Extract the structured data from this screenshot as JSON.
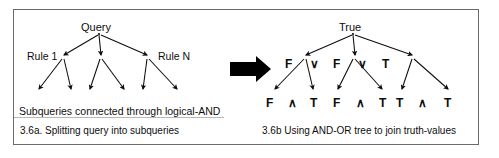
{
  "figure": {
    "ink_color": "#0d0d0d",
    "frame_color": "#6a6a6a",
    "background": "#ffffff"
  },
  "left_panel": {
    "root_label": "Query",
    "rule_left_label": "Rule 1",
    "rule_right_label": "Rule N",
    "summary_text": "Subqueries connected through logical-AND",
    "caption": "3.6a.  Splitting query into subqueries",
    "tree": {
      "root": {
        "x": 97,
        "y": 30,
        "label": "Query"
      },
      "level1": [
        {
          "x": 63,
          "y": 57
        },
        {
          "x": 100,
          "y": 57
        },
        {
          "x": 148,
          "y": 57
        }
      ],
      "leaves": [
        {
          "x": 38,
          "y": 92
        },
        {
          "x": 71,
          "y": 92
        },
        {
          "x": 101,
          "y": 92
        },
        {
          "x": 126,
          "y": 92
        },
        {
          "x": 145,
          "y": 92
        },
        {
          "x": 178,
          "y": 92
        }
      ]
    }
  },
  "transform_arrow": {
    "name": "transforms-into",
    "x": 232,
    "y": 62,
    "width": 38,
    "height": 16,
    "color": "#000000"
  },
  "right_panel": {
    "root_label": "True",
    "middle_row": [
      "F",
      "∨",
      "F",
      "∨",
      "T"
    ],
    "middle_values": [
      "F",
      "F",
      "T"
    ],
    "middle_operators": [
      "∨",
      "∨"
    ],
    "leaf_row": [
      "F",
      "∧",
      "T",
      "F",
      "∧",
      "T",
      "T",
      "∧",
      "T"
    ],
    "leaf_groups": [
      {
        "left": "F",
        "op": "∧",
        "right": "T",
        "result": "F"
      },
      {
        "left": "F",
        "op": "∧",
        "right": "T",
        "result": "F"
      },
      {
        "left": "T",
        "op": "∧",
        "right": "T",
        "result": "T"
      }
    ],
    "caption": "3.6b Using AND-OR tree to join truth-values",
    "tree": {
      "root": {
        "x": 352,
        "y": 30,
        "label": "True"
      },
      "level1": [
        {
          "x": 318,
          "y": 57
        },
        {
          "x": 366,
          "y": 57
        },
        {
          "x": 414,
          "y": 57
        }
      ],
      "leaves": [
        {
          "x": 286,
          "y": 92
        },
        {
          "x": 326,
          "y": 92
        },
        {
          "x": 354,
          "y": 92
        },
        {
          "x": 394,
          "y": 92
        },
        {
          "x": 414,
          "y": 92
        },
        {
          "x": 455,
          "y": 92
        }
      ]
    }
  },
  "labels": {
    "left_middle_positions": [
      {
        "text": "F",
        "x": 285,
        "y": 60
      },
      {
        "text": "∨",
        "x": 310,
        "y": 60
      },
      {
        "text": "F",
        "x": 333,
        "y": 60
      },
      {
        "text": "∨",
        "x": 358,
        "y": 60
      },
      {
        "text": "T",
        "x": 382,
        "y": 60
      }
    ],
    "leaf_positions": [
      {
        "text": "F",
        "x": 268,
        "y": 99
      },
      {
        "text": "∧",
        "x": 289,
        "y": 99
      },
      {
        "text": "T",
        "x": 310,
        "y": 99
      },
      {
        "text": "F",
        "x": 334,
        "y": 99
      },
      {
        "text": "∧",
        "x": 357,
        "y": 99
      },
      {
        "text": "T",
        "x": 380,
        "y": 99
      },
      {
        "text": "T",
        "x": 396,
        "y": 99
      },
      {
        "text": "∧",
        "x": 418,
        "y": 99
      },
      {
        "text": "T",
        "x": 444,
        "y": 99
      }
    ]
  }
}
